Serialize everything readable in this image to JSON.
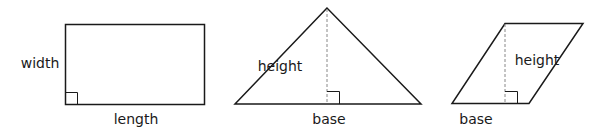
{
  "shapes": {
    "rectangle": {
      "side_label": "width",
      "bottom_label": "length"
    },
    "triangle": {
      "height_label": "height",
      "base_label": "base"
    },
    "parallelogram": {
      "height_label": "height",
      "base_label": "base"
    }
  },
  "colors": {
    "stroke": "#1a1a1a",
    "dashed": "#888888",
    "background": "#ffffff"
  }
}
